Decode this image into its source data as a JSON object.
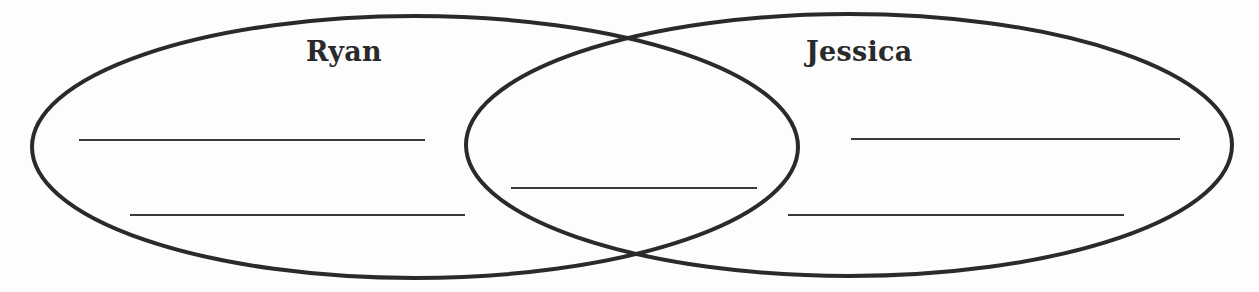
{
  "diagram": {
    "type": "venn",
    "sets": [
      {
        "id": "left",
        "label": "Ryan"
      },
      {
        "id": "right",
        "label": "Jessica"
      }
    ],
    "regions": {
      "left_only": {
        "blank_lines": 2
      },
      "overlap": {
        "blank_lines": 1
      },
      "right_only": {
        "blank_lines": 2
      }
    },
    "colors": {
      "stroke": "#2a2a2a",
      "background": "#fdfdfd",
      "line": "#3a3a3a"
    }
  }
}
